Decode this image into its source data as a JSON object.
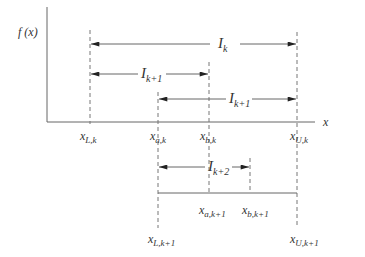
{
  "diagram": {
    "axes": {
      "y_label": "f (x)",
      "x_label": "x"
    },
    "points_level_k": [
      {
        "id": "xLk",
        "base": "x",
        "sub": "L,k"
      },
      {
        "id": "xak",
        "base": "x",
        "sub": "a,k"
      },
      {
        "id": "xbk",
        "base": "x",
        "sub": "b,k"
      },
      {
        "id": "xUk",
        "base": "x",
        "sub": "U,k"
      }
    ],
    "points_level_k1": [
      {
        "id": "xak1",
        "base": "x",
        "sub": "a,k+1"
      },
      {
        "id": "xbk1",
        "base": "x",
        "sub": "b,k+1"
      },
      {
        "id": "xLk1",
        "base": "x",
        "sub": "L,k+1"
      },
      {
        "id": "xUk1",
        "base": "x",
        "sub": "U,k+1"
      }
    ],
    "intervals": [
      {
        "id": "Ik",
        "base": "I",
        "sub": "k",
        "from": "xLk",
        "to": "xUk"
      },
      {
        "id": "Ik1_left",
        "base": "I",
        "sub": "k+1",
        "from": "xLk",
        "to": "xbk"
      },
      {
        "id": "Ik1_right",
        "base": "I",
        "sub": "k+1",
        "from": "xak",
        "to": "xUk"
      },
      {
        "id": "Ik2",
        "base": "I",
        "sub": "k+2",
        "from": "xak",
        "to": "xbk1"
      }
    ],
    "colors": {
      "line": "#555555",
      "text": "#333333"
    }
  }
}
